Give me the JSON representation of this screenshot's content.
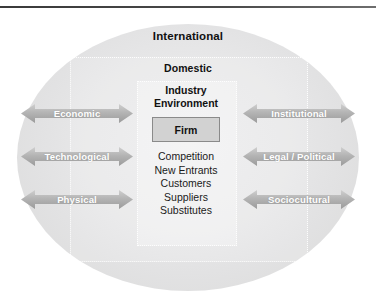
{
  "diagram": {
    "title_hidden": "",
    "rings": {
      "outer_label": "International",
      "middle_label": "Domestic",
      "inner_label_line1": "Industry",
      "inner_label_line2": "Environment"
    },
    "core": {
      "firm_label": "Firm"
    },
    "industry_forces": [
      "Competition",
      "New Entrants",
      "Customers",
      "Suppliers",
      "Substitutes"
    ],
    "left_arrows": [
      {
        "label": "Economic"
      },
      {
        "label": "Technological"
      },
      {
        "label": "Physical"
      }
    ],
    "right_arrows": [
      {
        "label": "Institutional"
      },
      {
        "label": "Legal / Political"
      },
      {
        "label": "Sociocultural"
      }
    ],
    "colors": {
      "arrow_fill_start": "#c9c9c9",
      "arrow_fill_end": "#9d9d9d",
      "ellipse_fill": "#e6e6e7",
      "firm_fill": "#d2d2d2",
      "firm_border": "#8a8a8a",
      "text_dark": "#111111",
      "text_light": "#ffffff",
      "rule": "#3f3f3f"
    }
  }
}
